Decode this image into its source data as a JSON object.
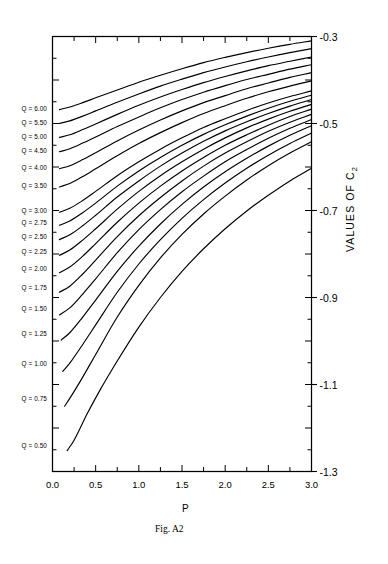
{
  "figure": {
    "caption": "Fig. A2",
    "x_axis_title": "P",
    "y_axis_title_main": "VALUES  OF  C",
    "y_axis_title_sub": "2"
  },
  "chart_data": {
    "type": "line",
    "title": "Fig. A2",
    "xlabel": "P",
    "ylabel": "VALUES OF C2",
    "xlim": [
      0.0,
      3.0
    ],
    "ylim": [
      -1.3,
      -0.3
    ],
    "grid": false,
    "legend": "inline-left-labels",
    "x_ticks": [
      0.0,
      0.25,
      0.5,
      0.75,
      1.0,
      1.25,
      1.5,
      1.75,
      2.0,
      2.25,
      2.5,
      2.75,
      3.0
    ],
    "x_tick_labels": [
      "0.0",
      "",
      "0.5",
      "",
      "1.0",
      "",
      "1.5",
      "",
      "2.0",
      "",
      "2.5",
      "",
      "3.0"
    ],
    "x_major_labels": [
      {
        "value": 0.0,
        "label": "0.0"
      },
      {
        "value": 0.5,
        "label": "0.5"
      },
      {
        "value": 1.0,
        "label": "1.0"
      },
      {
        "value": 1.5,
        "label": "1.5"
      },
      {
        "value": 2.0,
        "label": "2.0"
      },
      {
        "value": 2.5,
        "label": "2.5"
      },
      {
        "value": 3.0,
        "label": "3.0"
      }
    ],
    "y_major_labels": [
      {
        "value": -0.3,
        "label": "-0.3"
      },
      {
        "value": -0.5,
        "label": "-0.5"
      },
      {
        "value": -0.7,
        "label": "-0.7"
      },
      {
        "value": -0.9,
        "label": "-0.9"
      },
      {
        "value": -1.1,
        "label": "-1.1"
      },
      {
        "value": -1.3,
        "label": "-1.3"
      }
    ],
    "y_minor_step": 0.05,
    "series": [
      {
        "name": "Q = 6.00",
        "label": "Q = 6.00",
        "label_y": -0.465,
        "x": [
          0.08,
          0.2,
          0.35,
          0.5,
          0.75,
          1.0,
          1.25,
          1.5,
          1.75,
          2.0,
          2.25,
          2.5,
          2.75,
          3.0
        ],
        "y": [
          -0.468,
          -0.462,
          -0.452,
          -0.441,
          -0.423,
          -0.405,
          -0.389,
          -0.374,
          -0.36,
          -0.348,
          -0.337,
          -0.327,
          -0.318,
          -0.31
        ]
      },
      {
        "name": "Q = 5.50",
        "label": "Q = 5.50",
        "label_y": -0.497,
        "x": [
          0.08,
          0.2,
          0.35,
          0.5,
          0.75,
          1.0,
          1.25,
          1.5,
          1.75,
          2.0,
          2.25,
          2.5,
          2.75,
          3.0
        ],
        "y": [
          -0.5,
          -0.494,
          -0.483,
          -0.471,
          -0.451,
          -0.432,
          -0.414,
          -0.398,
          -0.383,
          -0.37,
          -0.358,
          -0.347,
          -0.337,
          -0.328
        ]
      },
      {
        "name": "Q = 5.00",
        "label": "Q = 5.00",
        "label_y": -0.529,
        "x": [
          0.08,
          0.2,
          0.35,
          0.5,
          0.75,
          1.0,
          1.25,
          1.5,
          1.75,
          2.0,
          2.25,
          2.5,
          2.75,
          3.0
        ],
        "y": [
          -0.532,
          -0.526,
          -0.514,
          -0.501,
          -0.479,
          -0.458,
          -0.439,
          -0.422,
          -0.406,
          -0.392,
          -0.379,
          -0.367,
          -0.357,
          -0.347
        ]
      },
      {
        "name": "Q = 4.50",
        "label": "Q = 4.50",
        "label_y": -0.561,
        "x": [
          0.08,
          0.2,
          0.35,
          0.5,
          0.75,
          1.0,
          1.25,
          1.5,
          1.75,
          2.0,
          2.25,
          2.5,
          2.75,
          3.0
        ],
        "y": [
          -0.565,
          -0.558,
          -0.545,
          -0.531,
          -0.507,
          -0.485,
          -0.464,
          -0.445,
          -0.428,
          -0.413,
          -0.399,
          -0.387,
          -0.375,
          -0.365
        ]
      },
      {
        "name": "Q = 4.00",
        "label": "Q = 4.00",
        "label_y": -0.6,
        "x": [
          0.08,
          0.2,
          0.35,
          0.5,
          0.75,
          1.0,
          1.25,
          1.5,
          1.75,
          2.0,
          2.25,
          2.5,
          2.75,
          3.0
        ],
        "y": [
          -0.604,
          -0.597,
          -0.583,
          -0.567,
          -0.54,
          -0.515,
          -0.492,
          -0.471,
          -0.452,
          -0.436,
          -0.42,
          -0.407,
          -0.394,
          -0.383
        ]
      },
      {
        "name": "Q = 3.50",
        "label": "Q = 3.50",
        "label_y": -0.641,
        "x": [
          0.08,
          0.2,
          0.35,
          0.5,
          0.75,
          1.0,
          1.25,
          1.5,
          1.75,
          2.0,
          2.25,
          2.5,
          2.75,
          3.0
        ],
        "y": [
          -0.646,
          -0.638,
          -0.622,
          -0.604,
          -0.574,
          -0.546,
          -0.521,
          -0.498,
          -0.477,
          -0.459,
          -0.442,
          -0.427,
          -0.414,
          -0.402
        ]
      },
      {
        "name": "Q = 3.00",
        "label": "Q = 3.00",
        "label_y": -0.698,
        "x": [
          0.08,
          0.2,
          0.35,
          0.5,
          0.75,
          1.0,
          1.25,
          1.5,
          1.75,
          2.0,
          2.25,
          2.5,
          2.75,
          3.0
        ],
        "y": [
          -0.704,
          -0.695,
          -0.677,
          -0.656,
          -0.62,
          -0.588,
          -0.559,
          -0.533,
          -0.509,
          -0.489,
          -0.47,
          -0.453,
          -0.438,
          -0.425
        ]
      },
      {
        "name": "Q = 2.75",
        "label": "Q = 2.75",
        "label_y": -0.727,
        "x": [
          0.08,
          0.2,
          0.35,
          0.5,
          0.75,
          1.0,
          1.25,
          1.5,
          1.75,
          2.0,
          2.25,
          2.5,
          2.75,
          3.0
        ],
        "y": [
          -0.734,
          -0.724,
          -0.705,
          -0.683,
          -0.644,
          -0.609,
          -0.578,
          -0.55,
          -0.525,
          -0.503,
          -0.483,
          -0.465,
          -0.449,
          -0.435
        ]
      },
      {
        "name": "Q = 2.50",
        "label": "Q = 2.50",
        "label_y": -0.759,
        "x": [
          0.08,
          0.2,
          0.35,
          0.5,
          0.75,
          1.0,
          1.25,
          1.5,
          1.75,
          2.0,
          2.25,
          2.5,
          2.75,
          3.0
        ],
        "y": [
          -0.767,
          -0.756,
          -0.735,
          -0.711,
          -0.669,
          -0.632,
          -0.598,
          -0.568,
          -0.541,
          -0.517,
          -0.496,
          -0.477,
          -0.46,
          -0.445
        ]
      },
      {
        "name": "Q = 2.25",
        "label": "Q = 2.25",
        "label_y": -0.794,
        "x": [
          0.08,
          0.2,
          0.35,
          0.5,
          0.75,
          1.0,
          1.25,
          1.5,
          1.75,
          2.0,
          2.25,
          2.5,
          2.75,
          3.0
        ],
        "y": [
          -0.803,
          -0.791,
          -0.768,
          -0.742,
          -0.697,
          -0.656,
          -0.62,
          -0.588,
          -0.559,
          -0.533,
          -0.51,
          -0.49,
          -0.472,
          -0.456
        ]
      },
      {
        "name": "Q = 2.00",
        "label": "Q = 2.00",
        "label_y": -0.832,
        "x": [
          0.08,
          0.2,
          0.35,
          0.5,
          0.75,
          1.0,
          1.25,
          1.5,
          1.75,
          2.0,
          2.25,
          2.5,
          2.75,
          3.0
        ],
        "y": [
          -0.843,
          -0.83,
          -0.805,
          -0.776,
          -0.727,
          -0.683,
          -0.644,
          -0.609,
          -0.578,
          -0.55,
          -0.526,
          -0.504,
          -0.484,
          -0.467
        ]
      },
      {
        "name": "Q = 1.75",
        "label": "Q = 1.75",
        "label_y": -0.876,
        "x": [
          0.08,
          0.2,
          0.35,
          0.5,
          0.75,
          1.0,
          1.25,
          1.5,
          1.75,
          2.0,
          2.25,
          2.5,
          2.75,
          3.0
        ],
        "y": [
          -0.888,
          -0.874,
          -0.846,
          -0.814,
          -0.76,
          -0.712,
          -0.67,
          -0.632,
          -0.598,
          -0.568,
          -0.542,
          -0.518,
          -0.497,
          -0.479
        ]
      },
      {
        "name": "Q = 1.50",
        "label": "Q = 1.50",
        "label_y": -0.925,
        "x": [
          0.08,
          0.2,
          0.35,
          0.5,
          0.75,
          1.0,
          1.25,
          1.5,
          1.75,
          2.0,
          2.25,
          2.5,
          2.75,
          3.0
        ],
        "y": [
          -0.94,
          -0.924,
          -0.892,
          -0.857,
          -0.797,
          -0.744,
          -0.698,
          -0.657,
          -0.621,
          -0.588,
          -0.56,
          -0.534,
          -0.511,
          -0.491
        ]
      },
      {
        "name": "Q = 1.25",
        "label": "Q = 1.25",
        "label_y": -0.981,
        "x": [
          0.1,
          0.2,
          0.35,
          0.5,
          0.75,
          1.0,
          1.25,
          1.5,
          1.75,
          2.0,
          2.25,
          2.5,
          2.75,
          3.0
        ],
        "y": [
          -0.998,
          -0.981,
          -0.945,
          -0.906,
          -0.84,
          -0.782,
          -0.731,
          -0.686,
          -0.646,
          -0.611,
          -0.58,
          -0.552,
          -0.527,
          -0.505
        ]
      },
      {
        "name": "Q = 1.00",
        "label": "Q = 1.00",
        "label_y": -1.051,
        "x": [
          0.12,
          0.2,
          0.35,
          0.5,
          0.75,
          1.0,
          1.25,
          1.5,
          1.75,
          2.0,
          2.25,
          2.5,
          2.75,
          3.0
        ],
        "y": [
          -1.07,
          -1.051,
          -1.008,
          -0.963,
          -0.888,
          -0.823,
          -0.767,
          -0.718,
          -0.675,
          -0.637,
          -0.603,
          -0.573,
          -0.546,
          -0.522
        ]
      },
      {
        "name": "Q = 0.75",
        "label": "Q = 0.75",
        "label_y": -1.132,
        "x": [
          0.14,
          0.2,
          0.35,
          0.5,
          0.75,
          1.0,
          1.25,
          1.5,
          1.75,
          2.0,
          2.25,
          2.5,
          2.75,
          3.0
        ],
        "y": [
          -1.15,
          -1.132,
          -1.083,
          -1.031,
          -0.945,
          -0.872,
          -0.809,
          -0.755,
          -0.708,
          -0.667,
          -0.63,
          -0.597,
          -0.568,
          -0.542
        ]
      },
      {
        "name": "Q = 0.50",
        "label": "Q = 0.50",
        "label_y": -1.239,
        "x": [
          0.17,
          0.25,
          0.4,
          0.55,
          0.75,
          1.0,
          1.25,
          1.5,
          1.75,
          2.0,
          2.25,
          2.5,
          2.75,
          3.0
        ],
        "y": [
          -1.252,
          -1.228,
          -1.168,
          -1.113,
          -1.046,
          -0.968,
          -0.9,
          -0.84,
          -0.788,
          -0.742,
          -0.701,
          -0.665,
          -0.632,
          -0.603
        ]
      }
    ]
  }
}
